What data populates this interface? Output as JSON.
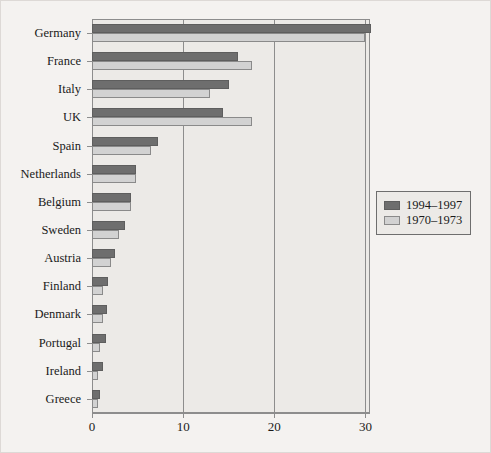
{
  "chart_data": {
    "type": "bar",
    "orientation": "horizontal",
    "title": "",
    "xlabel": "",
    "ylabel": "",
    "xlim": [
      0,
      30.5
    ],
    "xticks": [
      0,
      10,
      20,
      30
    ],
    "xticklabels": [
      "0",
      "10",
      "20",
      "30"
    ],
    "grid": true,
    "grid_axis": "x",
    "legend_position": "right",
    "categories": [
      "Germany",
      "France",
      "Italy",
      "UK",
      "Spain",
      "Netherlands",
      "Belgium",
      "Sweden",
      "Austria",
      "Finland",
      "Denmark",
      "Portugal",
      "Ireland",
      "Greece"
    ],
    "series": [
      {
        "name": "1994–1997",
        "color": "#6e6e6e",
        "values": [
          30.6,
          16.0,
          15.0,
          14.4,
          7.2,
          4.8,
          4.3,
          3.6,
          2.5,
          1.8,
          1.7,
          1.5,
          1.2,
          0.9
        ]
      },
      {
        "name": "1970–1973",
        "color": "#d2d2d2",
        "values": [
          30.0,
          17.5,
          13.0,
          17.5,
          6.5,
          4.8,
          4.3,
          3.0,
          2.1,
          1.2,
          1.2,
          0.9,
          0.7,
          0.7
        ]
      }
    ]
  },
  "legend": {
    "entries": [
      {
        "label": "1994–1997",
        "swatch": "dark-gray-swatch"
      },
      {
        "label": "1970–1973",
        "swatch": "light-gray-swatch"
      }
    ]
  },
  "colors": {
    "series_new": "#6e6e6e",
    "series_old": "#d2d2d2",
    "plot_background": "#eceae7",
    "figure_background": "#f4f2f0",
    "axis": "#8d8d8d",
    "text": "#1a1a1a"
  }
}
